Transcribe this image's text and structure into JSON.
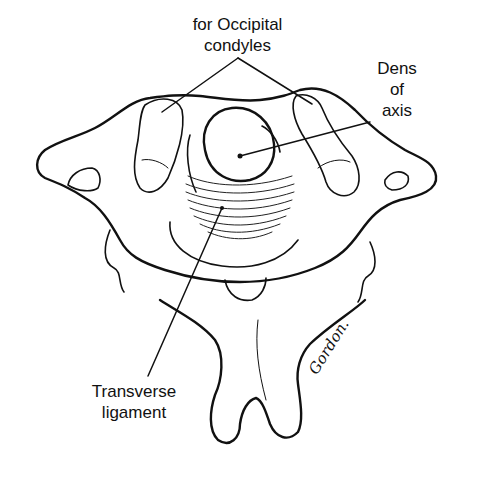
{
  "figure": {
    "line_color": "#111111",
    "background": "#ffffff"
  },
  "labels": {
    "occipital": {
      "line1": "for Occipital",
      "line2": "condyles"
    },
    "dens": {
      "line1": "Dens",
      "line2": "of",
      "line3": "axis"
    },
    "transverse": {
      "line1": "Transverse",
      "line2": "ligament"
    }
  },
  "signature": "Gordon."
}
